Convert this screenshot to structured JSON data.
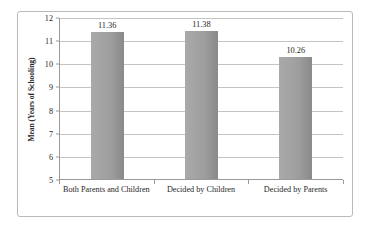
{
  "chart_data": {
    "type": "bar",
    "title": "",
    "xlabel": "",
    "ylabel": "Mean (Years of Schooling)",
    "categories": [
      "Both Parents and Children",
      "Decided by Children",
      "Decided by Parents"
    ],
    "values": [
      11.36,
      11.38,
      10.26
    ],
    "value_labels": [
      "11.36",
      "11.38",
      "10.26"
    ],
    "ylim": [
      5,
      12
    ],
    "ytick_labels": [
      "12",
      "11",
      "10",
      "9",
      "8",
      "7",
      "6",
      "5"
    ],
    "ytick_values": [
      12,
      11,
      10,
      9,
      8,
      7,
      6,
      5
    ],
    "grid": true,
    "legend": "none",
    "bar_color": "#a0a0a0",
    "gridline_color": "#c4c4c4",
    "axis_color": "#9a9a9a",
    "frame_color": "#b9b9b9",
    "text_color": "#1f1f1f"
  },
  "axis": {
    "y_title": "Mean (Years of Schooling)"
  }
}
